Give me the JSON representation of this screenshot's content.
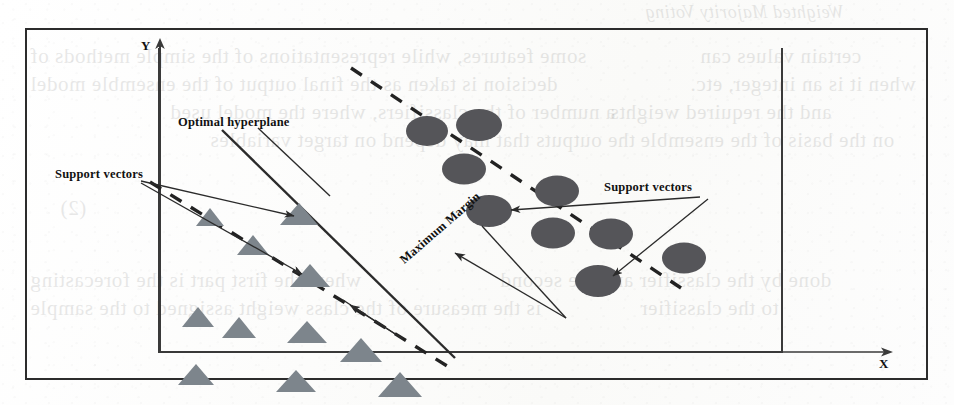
{
  "figure": {
    "title_semantic": "SVM optimal hyperplane with maximum margin and support vectors",
    "axes": {
      "x_label": "X",
      "y_label": "Y"
    },
    "labels": {
      "optimal_hyperplane": "Optimal  hyperplane",
      "support_vectors_left": "Support vectors",
      "support_vectors_right": "Support vectors",
      "maximum_margin": "Maximum  Margin"
    },
    "colors": {
      "triangle_fill": "#7d858c",
      "circle_fill": "#555559",
      "line_stroke": "#2b2b2b",
      "frame_stroke": "#2c2c2c",
      "axis_stroke": "#3a3a3a",
      "paper": "#fdfdfc"
    }
  },
  "chart_data": {
    "type": "scatter",
    "xlabel": "X",
    "ylabel": "Y",
    "xlim": [
      0,
      100
    ],
    "ylim": [
      0,
      100
    ],
    "grid": false,
    "legend": "none",
    "series": [
      {
        "name": "Class A (triangles)",
        "marker": "triangle",
        "color": "#7d858c",
        "points": [
          {
            "x": 6.4,
            "y": 63.0,
            "support_vector": false
          },
          {
            "x": 15.2,
            "y": 53.5,
            "support_vector": false
          },
          {
            "x": 24.0,
            "y": 63.5,
            "support_vector": true
          },
          {
            "x": 4.0,
            "y": 30.0,
            "support_vector": false
          },
          {
            "x": 16.3,
            "y": 26.5,
            "support_vector": false
          },
          {
            "x": 31.6,
            "y": 42.0,
            "support_vector": true
          },
          {
            "x": 29.0,
            "y": 24.0,
            "support_vector": false
          },
          {
            "x": 5.2,
            "y": 9.0,
            "support_vector": false
          },
          {
            "x": 28.6,
            "y": 7.5,
            "support_vector": false
          },
          {
            "x": 42.5,
            "y": 18.0,
            "support_vector": false
          },
          {
            "x": 54.0,
            "y": 6.5,
            "support_vector": false
          }
        ]
      },
      {
        "name": "Class B (circles)",
        "marker": "ellipse",
        "color": "#555559",
        "points": [
          {
            "x": 44.6,
            "y": 86.0,
            "support_vector": false
          },
          {
            "x": 53.0,
            "y": 90.5,
            "support_vector": false
          },
          {
            "x": 50.5,
            "y": 74.5,
            "support_vector": false
          },
          {
            "x": 65.5,
            "y": 66.5,
            "support_vector": false
          },
          {
            "x": 52.2,
            "y": 55.5,
            "support_vector": true
          },
          {
            "x": 62.5,
            "y": 47.5,
            "support_vector": false
          },
          {
            "x": 71.8,
            "y": 47.0,
            "support_vector": false
          },
          {
            "x": 83.5,
            "y": 39.0,
            "support_vector": false
          },
          {
            "x": 69.5,
            "y": 30.0,
            "support_vector": true
          }
        ]
      }
    ],
    "lines": [
      {
        "name": "optimal hyperplane",
        "style": "solid",
        "from": {
          "x": 9.0,
          "y": 94.0
        },
        "to": {
          "x": 46.5,
          "y": -2.0
        }
      },
      {
        "name": "margin boundary (class A side)",
        "style": "dashed",
        "from": {
          "x": -2.0,
          "y": 84.5
        },
        "to": {
          "x": 46.0,
          "y": -5.0
        }
      },
      {
        "name": "margin boundary (class B side)",
        "style": "dashed",
        "from": {
          "x": 31.5,
          "y": 106.0
        },
        "to": {
          "x": 84.0,
          "y": 0.0
        }
      }
    ],
    "annotations": [
      {
        "text": "Optimal  hyperplane",
        "kind": "label-with-leader"
      },
      {
        "text": "Support vectors",
        "kind": "label-with-leader",
        "side": "left",
        "arrows": 2
      },
      {
        "text": "Support vectors",
        "kind": "label-with-leader",
        "side": "right",
        "arrows": 2
      },
      {
        "text": "Maximum  Margin",
        "kind": "double-headed-arrow",
        "rotation_deg": -41
      }
    ]
  },
  "background_bleed": {
    "note": "faint mirrored show-through text from the reverse of the scanned page",
    "lines": [
      {
        "text": "Weighted Majority Voting",
        "x": 645,
        "y": 2,
        "size": "med",
        "italic": true
      },
      {
        "text": "some features, while representations of the simple methods of",
        "x": 30,
        "y": 44,
        "size": "big"
      },
      {
        "text": "certain values can",
        "x": 700,
        "y": 44,
        "size": "big"
      },
      {
        "text": "decision is taken as the final output of the ensemble model",
        "x": 30,
        "y": 72,
        "size": "big"
      },
      {
        "text": "when it is an integer, etc.",
        "x": 690,
        "y": 72,
        "size": "big"
      },
      {
        "text": "a number of the classifiers, where the model used",
        "x": 170,
        "y": 100,
        "size": "big"
      },
      {
        "text": "and the required weights",
        "x": 610,
        "y": 100,
        "size": "big"
      },
      {
        "text": "the outputs that may depend on target variables",
        "x": 210,
        "y": 128,
        "size": "big"
      },
      {
        "text": "on the basis of the ensemble",
        "x": 640,
        "y": 128,
        "size": "big"
      },
      {
        "text": "(2)",
        "x": 60,
        "y": 196,
        "size": "big"
      },
      {
        "text": "where the first part is the forecasting",
        "x": 30,
        "y": 268,
        "size": "big"
      },
      {
        "text": "done by the classifier and the second",
        "x": 500,
        "y": 268,
        "size": "big"
      },
      {
        "text": "is the measure of the class weight assigned to the sample",
        "x": 30,
        "y": 296,
        "size": "big"
      },
      {
        "text": "to the classifier",
        "x": 640,
        "y": 296,
        "size": "big"
      }
    ]
  }
}
